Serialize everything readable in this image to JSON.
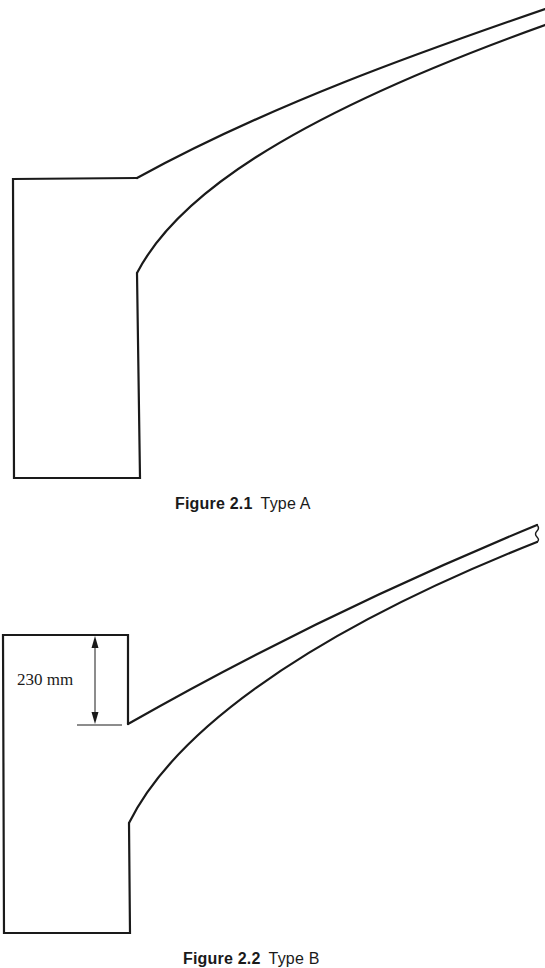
{
  "figures": [
    {
      "id": "figure-2-1",
      "number": "Figure 2.1",
      "title": "Type A",
      "description": "Cross-section profile: rectangular base block with a curved tapering arm rising to the upper right"
    },
    {
      "id": "figure-2-2",
      "number": "Figure 2.2",
      "title": "Type B",
      "description": "Cross-section profile: rectangular base block with a 230 mm upstand above the arm junction, curved tapering arm rising to the upper right, break line at arm end",
      "dimension": {
        "label": "230 mm",
        "value": 230,
        "unit": "mm"
      }
    }
  ],
  "colors": {
    "line": "#1a1a1a",
    "background": "#ffffff"
  }
}
